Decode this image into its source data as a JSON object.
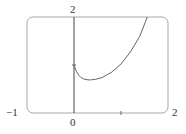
{
  "chart_data": {
    "type": "line",
    "title": "",
    "xlabel": "",
    "ylabel": "",
    "xlim": [
      -1,
      2
    ],
    "ylim": [
      0,
      2
    ],
    "grid": false,
    "tick_labels": {
      "x_min": "−1",
      "x_zero": "0",
      "x_max": "2",
      "y_max": "2"
    },
    "x_ticks": [
      1
    ],
    "series": [
      {
        "name": "f(x)",
        "x": [
          0,
          0.05,
          0.1,
          0.15,
          0.2,
          0.3,
          0.35,
          0.45,
          0.6,
          0.8,
          1.0,
          1.2,
          1.4,
          1.56
        ],
        "y": [
          1.0,
          0.87,
          0.79,
          0.74,
          0.71,
          0.69,
          0.69,
          0.7,
          0.74,
          0.85,
          1.02,
          1.27,
          1.6,
          2.0
        ]
      }
    ]
  }
}
